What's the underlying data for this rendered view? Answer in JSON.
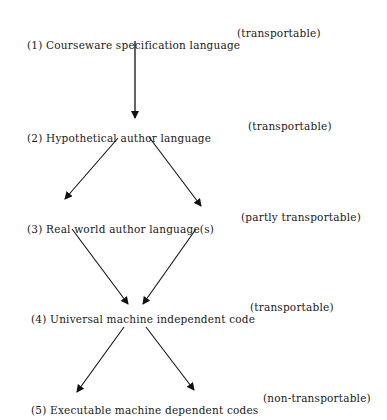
{
  "levels": [
    {
      "num": "(1)",
      "label": "Courseware specification language",
      "note": "(transportable)"
    },
    {
      "num": "(2)",
      "label": "Hypothetical author language",
      "note": "(transportable)"
    },
    {
      "num": "(3)",
      "label": "Real world author language(s)",
      "note": "(partly transportable)"
    },
    {
      "num": "(4)",
      "label": "Universal machine independent code",
      "note": "(transportable)"
    },
    {
      "num": "(5)",
      "label": "Executable machine dependent codes",
      "note": "(non-transportable)"
    }
  ],
  "edges": [
    {
      "from": 1,
      "to": 2
    },
    {
      "from": 2,
      "to": 3,
      "side": "left"
    },
    {
      "from": 2,
      "to": 3,
      "side": "right"
    },
    {
      "from": 3,
      "to": 4,
      "side": "left"
    },
    {
      "from": 3,
      "to": 4,
      "side": "right"
    },
    {
      "from": 4,
      "to": 5,
      "side": "left"
    },
    {
      "from": 4,
      "to": 5,
      "side": "right"
    }
  ]
}
